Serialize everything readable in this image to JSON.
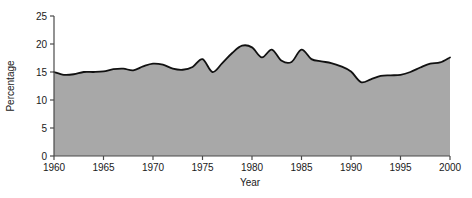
{
  "chart_data": {
    "type": "area",
    "title": "",
    "subtitle": "",
    "xlabel": "Year",
    "ylabel": "Percentage",
    "xlim": [
      1960,
      2000
    ],
    "ylim": [
      0,
      25
    ],
    "xticks": [
      1960,
      1965,
      1970,
      1975,
      1980,
      1985,
      1990,
      1995,
      2000
    ],
    "yticks": [
      0,
      5,
      10,
      15,
      20,
      25
    ],
    "grid": false,
    "legend": null,
    "fill_color": "#a8a8a8",
    "line_color": "#111111",
    "axis_color": "#4a4a4a",
    "series": [
      {
        "name": "Percentage",
        "x": [
          1960,
          1961,
          1962,
          1963,
          1964,
          1965,
          1966,
          1967,
          1968,
          1969,
          1970,
          1971,
          1972,
          1973,
          1974,
          1975,
          1976,
          1977,
          1978,
          1979,
          1980,
          1981,
          1982,
          1983,
          1984,
          1985,
          1986,
          1987,
          1988,
          1989,
          1990,
          1991,
          1992,
          1993,
          1994,
          1995,
          1996,
          1997,
          1998,
          1999,
          2000
        ],
        "values": [
          15.0,
          14.5,
          14.6,
          15.0,
          15.0,
          15.1,
          15.5,
          15.6,
          15.3,
          16.0,
          16.5,
          16.3,
          15.6,
          15.4,
          15.9,
          17.3,
          15.0,
          16.6,
          18.4,
          19.7,
          19.4,
          17.6,
          19.0,
          17.0,
          16.8,
          19.0,
          17.3,
          16.9,
          16.6,
          16.0,
          15.1,
          13.2,
          13.7,
          14.3,
          14.4,
          14.5,
          15.0,
          15.8,
          16.5,
          16.7,
          17.6
        ]
      }
    ]
  },
  "axis": {
    "y_tick_labels": [
      "0",
      "5",
      "10",
      "15",
      "20",
      "25"
    ],
    "x_tick_labels": [
      "1960",
      "1965",
      "1970",
      "1975",
      "1980",
      "1985",
      "1990",
      "1995",
      "2000"
    ],
    "x_axis_title": "Year",
    "y_axis_title": "Percentage"
  }
}
